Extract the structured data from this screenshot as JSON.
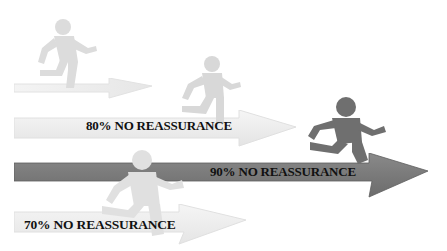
{
  "diagram": {
    "arrows": [
      {
        "id": "top",
        "label": "",
        "shade": "light"
      },
      {
        "id": "eighty",
        "label": "80% NO REASSURANCE",
        "shade": "light"
      },
      {
        "id": "ninety",
        "label": "90% NO REASSURANCE",
        "shade": "dark"
      },
      {
        "id": "seventy",
        "label": "70% NO REASSURANCE",
        "shade": "light"
      }
    ],
    "runners": [
      {
        "id": "runner-top",
        "shade": "light"
      },
      {
        "id": "runner-eighty",
        "shade": "light"
      },
      {
        "id": "runner-ninety",
        "shade": "dark"
      },
      {
        "id": "runner-seventy",
        "shade": "light"
      }
    ],
    "colors": {
      "light_arrow": "#eeeeee",
      "light_arrow_edge": "#d9d9d9",
      "dark_arrow": "#7a7a7a",
      "dark_arrow_edge": "#5e5e5e",
      "light_runner": "#dcdcdc",
      "dark_runner": "#6f6f6f",
      "label_text": "#111111"
    }
  }
}
